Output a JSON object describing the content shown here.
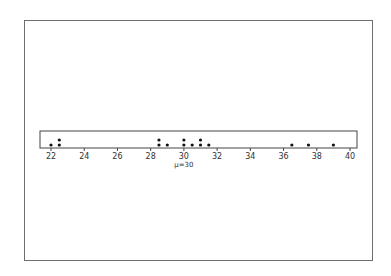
{
  "chart_data": {
    "type": "scatter",
    "subtype": "dot-plot",
    "title": "",
    "xlabel": "",
    "ylabel": "",
    "xlim": [
      21.3,
      40.5
    ],
    "xticks": [
      22,
      24,
      26,
      28,
      30,
      32,
      34,
      36,
      38,
      40
    ],
    "grid": false,
    "annotation": "μ=30",
    "annotation_x": 30,
    "points": [
      {
        "x": 22,
        "count": 1
      },
      {
        "x": 22.5,
        "count": 2
      },
      {
        "x": 28.5,
        "count": 2
      },
      {
        "x": 29,
        "count": 1
      },
      {
        "x": 30,
        "count": 2
      },
      {
        "x": 30.5,
        "count": 1
      },
      {
        "x": 31,
        "count": 2
      },
      {
        "x": 31.5,
        "count": 1
      },
      {
        "x": 36.5,
        "count": 1
      },
      {
        "x": 37.5,
        "count": 1
      },
      {
        "x": 39,
        "count": 1
      }
    ]
  },
  "colors": {
    "dot": "#111111",
    "axis": "#444444",
    "frame": "#6e6e6e"
  }
}
